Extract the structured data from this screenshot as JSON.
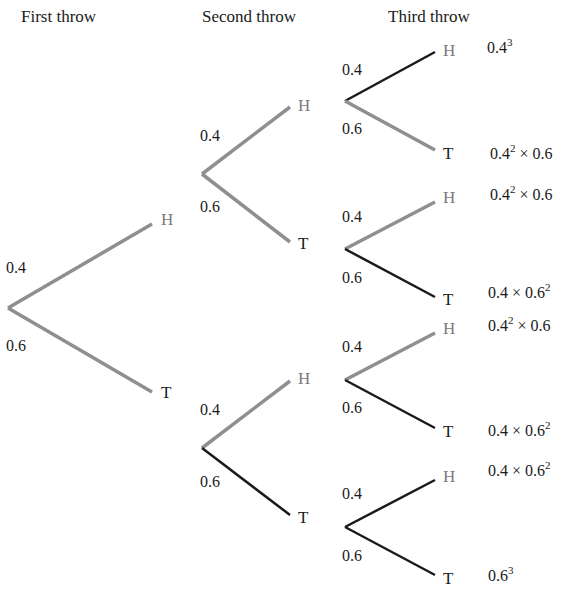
{
  "headers": {
    "first": "First throw",
    "second": "Second throw",
    "third": "Third throw"
  },
  "colors": {
    "grey_branch": "#8f8f8f",
    "black_branch": "#1a1a1a",
    "node_H": "#7a7a7a",
    "text": "#1a1a1a"
  },
  "probabilities": {
    "heads": "0.4",
    "tails": "0.6"
  },
  "tree": {
    "level1": [
      {
        "outcome": "H",
        "prob": "0.4"
      },
      {
        "outcome": "T",
        "prob": "0.6"
      }
    ],
    "level2": [
      {
        "parent": "H",
        "outcome": "H",
        "prob": "0.4"
      },
      {
        "parent": "H",
        "outcome": "T",
        "prob": "0.6"
      },
      {
        "parent": "T",
        "outcome": "H",
        "prob": "0.4"
      },
      {
        "parent": "T",
        "outcome": "T",
        "prob": "0.6"
      }
    ],
    "level3": [
      {
        "path": "HHH",
        "outcome": "H",
        "prob": "0.4",
        "result_base": "0.4",
        "result_exp": "3",
        "result_tail": ""
      },
      {
        "path": "HHT",
        "outcome": "T",
        "prob": "0.6",
        "result_base": "0.4",
        "result_exp": "2",
        "result_tail": " × 0.6"
      },
      {
        "path": "HTH",
        "outcome": "H",
        "prob": "0.4",
        "result_base": "0.4",
        "result_exp": "2",
        "result_tail": " × 0.6"
      },
      {
        "path": "HTT",
        "outcome": "T",
        "prob": "0.6",
        "result_base": "0.4 × 0.6",
        "result_exp": "2",
        "result_tail": ""
      },
      {
        "path": "THH",
        "outcome": "H",
        "prob": "0.4",
        "result_base": "0.4",
        "result_exp": "2",
        "result_tail": " × 0.6"
      },
      {
        "path": "THT",
        "outcome": "T",
        "prob": "0.6",
        "result_base": "0.4 × 0.6",
        "result_exp": "2",
        "result_tail": ""
      },
      {
        "path": "TTH",
        "outcome": "H",
        "prob": "0.4",
        "result_base": "0.4 × 0.6",
        "result_exp": "2",
        "result_tail": ""
      },
      {
        "path": "TTT",
        "outcome": "T",
        "prob": "0.6",
        "result_base": "0.6",
        "result_exp": "3",
        "result_tail": ""
      }
    ]
  }
}
